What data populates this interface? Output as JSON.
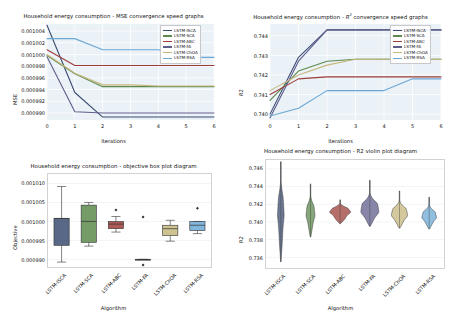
{
  "figure": {
    "background": "#ffffff",
    "dataset": "Household energy consumption"
  },
  "series_palette": {
    "LSTM-ISCA": "#3b4d71",
    "LSTM-SCA": "#5d8a4c",
    "LSTM-ABC": "#9e3d38",
    "LSTM-FA": "#5f5d8c",
    "LSTM-ChOA": "#c6b77c",
    "LSTM-RSA": "#6ba8d4"
  },
  "algorithms": [
    "LSTM-ISCA",
    "LSTM-SCA",
    "LSTM-ABC",
    "LSTM-FA",
    "LSTM-ChOA",
    "LSTM-RSA"
  ],
  "chart_data": [
    {
      "id": "mse-convergence",
      "type": "line",
      "title": "Household energy consumption - MSE convergence speed graphs",
      "xlabel": "Iterations",
      "ylabel": "MSE",
      "x": [
        0,
        1,
        2,
        3,
        4,
        5,
        6
      ],
      "xlim": [
        0,
        6
      ],
      "ylim": [
        0.0009888,
        0.0010052
      ],
      "xticks": [
        "0",
        "1",
        "2",
        "3",
        "4",
        "5",
        "6"
      ],
      "yticks": [
        "0.001004",
        "0.001002",
        "0.001000",
        "0.000998",
        "0.000996",
        "0.000994",
        "0.000992",
        "0.000990"
      ],
      "ytickvals": [
        0.001004,
        0.001002,
        0.001,
        0.000998,
        0.000996,
        0.000994,
        0.000992,
        0.00099
      ],
      "grid": true,
      "legend_position": "upper right",
      "series": [
        {
          "name": "LSTM-ISCA",
          "color": "#3b4d71",
          "values": [
            0.001005,
            0.0009935,
            0.0009893,
            0.0009893,
            0.0009893,
            0.0009893,
            0.0009893
          ]
        },
        {
          "name": "LSTM-SCA",
          "color": "#5d8a4c",
          "values": [
            0.0009998,
            0.0009967,
            0.0009945,
            0.0009945,
            0.0009945,
            0.0009945,
            0.0009945
          ]
        },
        {
          "name": "LSTM-ABC",
          "color": "#9e3d38",
          "values": [
            0.0010008,
            0.0009981,
            0.0009981,
            0.0009981,
            0.0009981,
            0.0009981,
            0.0009981
          ]
        },
        {
          "name": "LSTM-FA",
          "color": "#5f5d8c",
          "values": [
            0.0009996,
            0.0009902,
            0.00099,
            0.00099,
            0.00099,
            0.00099,
            0.00099
          ]
        },
        {
          "name": "LSTM-ChOA",
          "color": "#c6b77c",
          "values": [
            0.001,
            0.0009968,
            0.0009948,
            0.0009948,
            0.0009946,
            0.0009946,
            0.0009946
          ]
        },
        {
          "name": "LSTM-RSA",
          "color": "#6ba8d4",
          "values": [
            0.0010027,
            0.0010027,
            0.0010008,
            0.0010008,
            0.0010008,
            0.0009995,
            0.0009995
          ]
        }
      ]
    },
    {
      "id": "r2-convergence",
      "type": "line",
      "title_prefix": "Household energy consumption - ",
      "title_math": "R",
      "title_sup": "2",
      "title_suffix": " convergence speed graphs",
      "title": "Household energy consumption - R2 convergence speed graphs",
      "xlabel": "Iterations",
      "ylabel": "R2",
      "x": [
        0,
        1,
        2,
        3,
        4,
        5,
        6
      ],
      "xlim": [
        0,
        6
      ],
      "ylim": [
        0.7397,
        0.7446
      ],
      "xticks": [
        "0",
        "1",
        "2",
        "3",
        "4",
        "5",
        "6"
      ],
      "yticks": [
        "0.744",
        "0.743",
        "0.742",
        "0.741",
        "0.740"
      ],
      "ytickvals": [
        0.744,
        0.743,
        0.742,
        0.741,
        0.74
      ],
      "grid": true,
      "legend_position": "upper right",
      "series": [
        {
          "name": "LSTM-ISCA",
          "color": "#3b4d71",
          "values": [
            0.74,
            0.7429,
            0.7443,
            0.7443,
            0.7443,
            0.7443,
            0.7443
          ]
        },
        {
          "name": "LSTM-SCA",
          "color": "#5d8a4c",
          "values": [
            0.7407,
            0.7422,
            0.7427,
            0.7428,
            0.7428,
            0.7428,
            0.7428
          ]
        },
        {
          "name": "LSTM-ABC",
          "color": "#9e3d38",
          "values": [
            0.741,
            0.7418,
            0.7419,
            0.7419,
            0.7419,
            0.7419,
            0.7419
          ]
        },
        {
          "name": "LSTM-FA",
          "color": "#5f5d8c",
          "values": [
            0.7398,
            0.7427,
            0.7443,
            0.7443,
            0.7443,
            0.7443,
            0.7443
          ]
        },
        {
          "name": "LSTM-ChOA",
          "color": "#c6b77c",
          "values": [
            0.7412,
            0.742,
            0.7425,
            0.7428,
            0.7428,
            0.7428,
            0.7428
          ]
        },
        {
          "name": "LSTM-RSA",
          "color": "#6ba8d4",
          "values": [
            0.7399,
            0.7403,
            0.7412,
            0.7412,
            0.7412,
            0.7418,
            0.7418
          ]
        }
      ]
    },
    {
      "id": "objective-boxplot",
      "type": "box",
      "title": "Household energy consumption -  objective box plot diagram",
      "xlabel": "Algorithm",
      "ylabel": "Objective",
      "categories": [
        "LSTM-ISCA",
        "LSTM-SCA",
        "LSTM-ABC",
        "LSTM-FA",
        "LSTM-ChOA",
        "LSTM-RSA"
      ],
      "ylim": [
        0.000988,
        0.0010125
      ],
      "yticks": [
        "0.001010",
        "0.001005",
        "0.001000",
        "0.000995",
        "0.000990"
      ],
      "ytickvals": [
        0.00101,
        0.001005,
        0.001,
        0.000995,
        0.00099
      ],
      "grid": true,
      "boxes": [
        {
          "name": "LSTM-ISCA",
          "color": "#3b4d71",
          "whisker_low": 0.0009893,
          "q1": 0.0009937,
          "median": 0.0010008,
          "q3": 0.0010008,
          "whisker_high": 0.0010092,
          "outliers": []
        },
        {
          "name": "LSTM-SCA",
          "color": "#5d8a4c",
          "whisker_low": 0.0009935,
          "q1": 0.0009945,
          "median": 0.001,
          "q3": 0.0010043,
          "whisker_high": 0.001005,
          "outliers": []
        },
        {
          "name": "LSTM-ABC",
          "color": "#9e3d38",
          "whisker_low": 0.0009972,
          "q1": 0.0009981,
          "median": 0.0009993,
          "q3": 0.001,
          "whisker_high": 0.0010013,
          "outliers": [
            0.001003
          ]
        },
        {
          "name": "LSTM-FA",
          "color": "#5f5d8c",
          "whisker_low": 0.00099,
          "q1": 0.00099,
          "median": 0.00099,
          "q3": 0.00099,
          "whisker_high": 0.00099,
          "outliers": [
            0.0010012,
            0.0009885
          ]
        },
        {
          "name": "LSTM-ChOA",
          "color": "#c6b77c",
          "whisker_low": 0.0009948,
          "q1": 0.0009963,
          "median": 0.0009981,
          "q3": 0.000999,
          "whisker_high": 0.0010003,
          "outliers": []
        },
        {
          "name": "LSTM-RSA",
          "color": "#6ba8d4",
          "whisker_low": 0.0009968,
          "q1": 0.0009976,
          "median": 0.000999,
          "q3": 0.001,
          "whisker_high": 0.001,
          "outliers": [
            0.0010035
          ]
        }
      ]
    },
    {
      "id": "r2-violin",
      "type": "violin",
      "title": "Household energy consumption -  R2 violin plot diagram",
      "xlabel": "Algorithm",
      "ylabel": "R2",
      "categories": [
        "LSTM-ISCA",
        "LSTM-SCA",
        "LSTM-ABC",
        "LSTM-FA",
        "LSTM-ChOA",
        "LSTM-RSA"
      ],
      "ylim": [
        0.7348,
        0.747
      ],
      "yticks": [
        "0.746",
        "0.744",
        "0.742",
        "0.740",
        "0.738",
        "0.736"
      ],
      "ytickvals": [
        0.746,
        0.744,
        0.742,
        0.74,
        0.738,
        0.736
      ],
      "grid": true,
      "violins": [
        {
          "name": "LSTM-ISCA",
          "color": "#3b4d71",
          "min": 0.7355,
          "max": 0.7468,
          "median": 0.742,
          "width_peak": 0.3
        },
        {
          "name": "LSTM-SCA",
          "color": "#5d8a4c",
          "min": 0.7383,
          "max": 0.7443,
          "median": 0.7414,
          "width_peak": 0.38
        },
        {
          "name": "LSTM-ABC",
          "color": "#9e3d38",
          "min": 0.7398,
          "max": 0.7425,
          "median": 0.7414,
          "width_peak": 1.0
        },
        {
          "name": "LSTM-FA",
          "color": "#5f5d8c",
          "min": 0.7395,
          "max": 0.7447,
          "median": 0.7417,
          "width_peak": 0.72
        },
        {
          "name": "LSTM-ChOA",
          "color": "#c6b77c",
          "min": 0.7393,
          "max": 0.7435,
          "median": 0.7412,
          "width_peak": 0.66
        },
        {
          "name": "LSTM-RSA",
          "color": "#6ba8d4",
          "min": 0.7392,
          "max": 0.7428,
          "median": 0.7409,
          "width_peak": 0.6
        }
      ]
    }
  ]
}
